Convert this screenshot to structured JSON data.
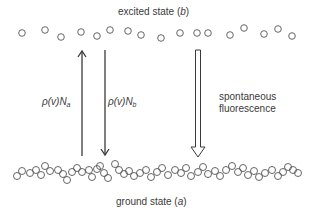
{
  "diagram": {
    "type": "energy-level-transition-diagram",
    "excited_state": {
      "label_text": "excited state (",
      "label_var": "b",
      "label_close": ")",
      "atoms": [
        [
          22,
          33
        ],
        [
          45,
          30
        ],
        [
          61,
          37
        ],
        [
          81,
          32
        ],
        [
          97,
          36
        ],
        [
          110,
          30
        ],
        [
          128,
          31
        ],
        [
          141,
          35
        ],
        [
          161,
          38
        ],
        [
          180,
          33
        ],
        [
          197,
          33
        ],
        [
          208,
          33
        ],
        [
          230,
          35
        ],
        [
          244,
          28
        ],
        [
          264,
          34
        ],
        [
          278,
          29
        ],
        [
          292,
          36
        ]
      ]
    },
    "ground_state": {
      "label_text": "ground state (",
      "label_var": "a",
      "label_close": ")",
      "atoms": [
        [
          17,
          176
        ],
        [
          22,
          171
        ],
        [
          30,
          173
        ],
        [
          36,
          170
        ],
        [
          41,
          175
        ],
        [
          45,
          166
        ],
        [
          50,
          171
        ],
        [
          58,
          170
        ],
        [
          63,
          174
        ],
        [
          67,
          180
        ],
        [
          72,
          172
        ],
        [
          77,
          168
        ],
        [
          82,
          172
        ],
        [
          89,
          170
        ],
        [
          92,
          177
        ],
        [
          97,
          169
        ],
        [
          100,
          166
        ],
        [
          104,
          173
        ],
        [
          108,
          178
        ],
        [
          115,
          164
        ],
        [
          119,
          170
        ],
        [
          124,
          174
        ],
        [
          129,
          171
        ],
        [
          134,
          176
        ],
        [
          140,
          173
        ],
        [
          146,
          170
        ],
        [
          151,
          177
        ],
        [
          157,
          172
        ],
        [
          162,
          168
        ],
        [
          168,
          175
        ],
        [
          175,
          170
        ],
        [
          181,
          173
        ],
        [
          186,
          168
        ],
        [
          191,
          176
        ],
        [
          198,
          172
        ],
        [
          203,
          167
        ],
        [
          208,
          174
        ],
        [
          215,
          171
        ],
        [
          220,
          176
        ],
        [
          226,
          170
        ],
        [
          232,
          166
        ],
        [
          238,
          172
        ],
        [
          243,
          168
        ],
        [
          248,
          175
        ],
        [
          254,
          171
        ],
        [
          259,
          177
        ],
        [
          265,
          173
        ],
        [
          272,
          170
        ],
        [
          278,
          176
        ],
        [
          283,
          172
        ],
        [
          288,
          167
        ],
        [
          293,
          170
        ],
        [
          298,
          173
        ]
      ]
    },
    "transitions": [
      {
        "id": "absorption",
        "direction": "up",
        "style": "solid",
        "x": 82,
        "y_top": 50,
        "y_bottom": 156,
        "label_rho": "ρ(v)N",
        "label_sub": "a"
      },
      {
        "id": "stimulated-emission",
        "direction": "down",
        "style": "solid",
        "x": 105,
        "y_top": 50,
        "y_bottom": 156,
        "label_rho": "ρ(v)N",
        "label_sub": "b"
      },
      {
        "id": "spontaneous-fluorescence",
        "direction": "down",
        "style": "hollow",
        "x": 198,
        "y_top": 50,
        "y_bottom": 157,
        "label_line1": "spontaneous",
        "label_line2": "fluorescence"
      }
    ],
    "colors": {
      "line": "#3a3a3a",
      "atom_stroke": "#555555",
      "text": "#3a3a3a"
    }
  }
}
